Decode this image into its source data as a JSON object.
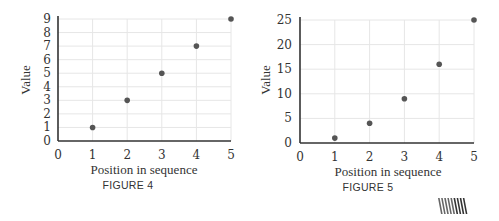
{
  "chart_data": [
    {
      "type": "scatter",
      "caption": "FIGURE 4",
      "xlabel": "Position in sequence",
      "ylabel": "Value",
      "x": [
        1,
        2,
        3,
        4,
        5
      ],
      "y": [
        1,
        3,
        5,
        7,
        9
      ],
      "xlim": [
        0,
        5
      ],
      "ylim": [
        0,
        9
      ],
      "xticks": [
        0,
        1,
        2,
        3,
        4,
        5
      ],
      "yticks": [
        0,
        1,
        2,
        3,
        4,
        5,
        6,
        7,
        8,
        9
      ],
      "grid": true,
      "legend": null
    },
    {
      "type": "scatter",
      "caption": "FIGURE 5",
      "xlabel": "Position in sequence",
      "ylabel": "Value",
      "x": [
        1,
        2,
        3,
        4,
        5
      ],
      "y": [
        1,
        4,
        9,
        16,
        25
      ],
      "xlim": [
        0,
        5
      ],
      "ylim": [
        0,
        25
      ],
      "xticks": [
        0,
        1,
        2,
        3,
        4,
        5
      ],
      "yticks": [
        0,
        5,
        10,
        15,
        20,
        25
      ],
      "grid": true,
      "legend": null
    }
  ],
  "colors": {
    "point": "#555555",
    "axis": "#333333",
    "grid": "#e6e6e6",
    "text": "#333333"
  },
  "publisher_mark": "striped-logo-icon"
}
